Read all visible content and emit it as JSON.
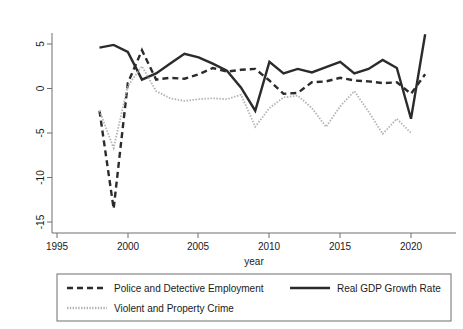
{
  "chart_data": {
    "type": "line",
    "title": "",
    "xlabel": "year",
    "ylabel": "",
    "xlim": [
      1994.2,
      2022.0
    ],
    "ylim": [
      -16.2,
      6.8
    ],
    "xticks": [
      1995,
      2000,
      2005,
      2010,
      2015,
      2020
    ],
    "xtick_labels": [
      "1995",
      "2000",
      "2005",
      "2010",
      "2015",
      "2020"
    ],
    "yticks": [
      5,
      0,
      -5,
      -10,
      -15
    ],
    "ytick_labels": [
      "5",
      "0",
      "-5",
      "-10",
      "-15"
    ],
    "grid": false,
    "legend_position": "below-plot",
    "series": [
      {
        "name": "Police and Detective Employment",
        "style": "dashed",
        "color": "#2b2b2b",
        "x": [
          1998,
          1999,
          2000,
          2001,
          2002,
          2003,
          2004,
          2005,
          2006,
          2007,
          2008,
          2009,
          2010,
          2011,
          2012,
          2013,
          2014,
          2015,
          2016,
          2017,
          2018,
          2019,
          2020,
          2021
        ],
        "values": [
          -2.5,
          -13.5,
          0.6,
          4.3,
          1.0,
          1.2,
          1.1,
          1.6,
          2.3,
          1.9,
          2.1,
          2.2,
          0.9,
          -0.6,
          -0.5,
          0.7,
          0.8,
          1.2,
          0.9,
          0.8,
          0.6,
          0.7,
          -0.6,
          1.6
        ]
      },
      {
        "name": "Real GDP Growth Rate",
        "style": "solid",
        "color": "#2b2b2b",
        "x": [
          1998,
          1999,
          2000,
          2001,
          2002,
          2003,
          2004,
          2005,
          2006,
          2007,
          2008,
          2009,
          2010,
          2011,
          2012,
          2013,
          2014,
          2015,
          2016,
          2017,
          2018,
          2019,
          2020,
          2021
        ],
        "values": [
          4.6,
          4.9,
          4.1,
          1.0,
          1.7,
          2.8,
          3.9,
          3.5,
          2.8,
          2.0,
          0.1,
          -2.5,
          3.0,
          1.7,
          2.2,
          1.8,
          2.4,
          3.0,
          1.7,
          2.2,
          3.2,
          2.3,
          -3.4,
          6.1
        ]
      },
      {
        "name": "Violent and Property Crime",
        "style": "dotted",
        "color": "#b3b3b3",
        "x": [
          1998,
          1999,
          2000,
          2001,
          2002,
          2003,
          2004,
          2005,
          2006,
          2007,
          2008,
          2009,
          2010,
          2011,
          2012,
          2013,
          2014,
          2015,
          2016,
          2017,
          2018,
          2019,
          2020
        ],
        "values": [
          -2.5,
          -6.7,
          0.3,
          2.5,
          -0.3,
          -1.1,
          -1.4,
          -1.2,
          -1.1,
          -1.2,
          -0.7,
          -4.3,
          -2.2,
          -1.0,
          -0.8,
          -2.2,
          -4.3,
          -2.0,
          -0.3,
          -2.6,
          -5.1,
          -3.4,
          -5.0
        ]
      }
    ]
  },
  "axis": {
    "x_title": "year"
  },
  "legend": {
    "items": [
      {
        "label": "Police and Detective Employment",
        "swatch": "dashed-line-swatch"
      },
      {
        "label": "Real GDP Growth Rate",
        "swatch": "solid-line-swatch"
      },
      {
        "label": "Violent and Property Crime",
        "swatch": "dotted-line-swatch"
      }
    ]
  }
}
